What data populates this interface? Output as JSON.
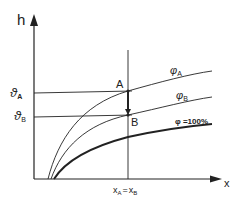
{
  "diagram": {
    "axes": {
      "y_label": "h",
      "x_label": "x"
    },
    "y_markers": [
      {
        "symbol": "ϑ",
        "sub": "A"
      },
      {
        "symbol": "ϑ",
        "sub": "B"
      }
    ],
    "x_marker": {
      "left": "x",
      "left_sub": "A",
      "eq": "=",
      "right": "x",
      "right_sub": "B"
    },
    "points": [
      {
        "label": "A"
      },
      {
        "label": "B"
      }
    ],
    "curves": [
      {
        "symbol": "φ",
        "sub": "A"
      },
      {
        "symbol": "φ",
        "sub": "B"
      },
      {
        "label": "φ =100%"
      }
    ],
    "colors": {
      "line": "#222222",
      "background": "#ffffff"
    }
  }
}
